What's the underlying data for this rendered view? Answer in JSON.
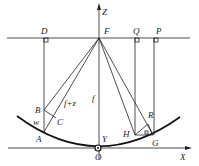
{
  "diagram": {
    "labels": {
      "Z": "Z",
      "D": "D",
      "F": "F",
      "Q": "Q",
      "P": "P",
      "B": "B",
      "C": "C",
      "f_plus_z": "f+z",
      "f": "f",
      "w": "w",
      "A": "A",
      "Y": "Y",
      "O": "O",
      "H": "H",
      "R": "R",
      "G": "G",
      "X": "X"
    },
    "colors": {
      "ink": "#222222",
      "background": "#ffffff"
    }
  }
}
